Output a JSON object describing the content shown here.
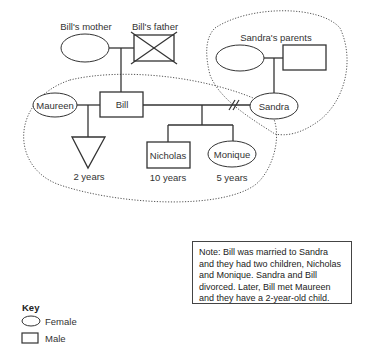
{
  "people": {
    "bills_mother": {
      "label": "Bill's mother",
      "sex": "female"
    },
    "bills_father": {
      "label": "Bill's father",
      "sex": "male",
      "deceased": true
    },
    "sandras_parents": {
      "label": "Sandra's parents"
    },
    "bill": {
      "label": "Bill",
      "sex": "male"
    },
    "maureen": {
      "label": "Maureen",
      "sex": "female"
    },
    "sandra": {
      "label": "Sandra",
      "sex": "female"
    },
    "unknown_child": {
      "age": "2 years",
      "sex": "unknown"
    },
    "nicholas": {
      "label": "Nicholas",
      "age": "10 years",
      "sex": "male"
    },
    "monique": {
      "label": "Monique",
      "age": "5 years",
      "sex": "female"
    }
  },
  "relationships": [
    {
      "between": [
        "bills_mother",
        "bills_father"
      ],
      "type": "married"
    },
    {
      "between": [
        "sandras_mother",
        "sandras_father"
      ],
      "type": "married"
    },
    {
      "between": [
        "bill",
        "maureen"
      ],
      "type": "married"
    },
    {
      "between": [
        "bill",
        "sandra"
      ],
      "type": "divorced"
    }
  ],
  "key": {
    "title": "Key",
    "items": [
      {
        "symbol": "ellipse",
        "label": "Female"
      },
      {
        "symbol": "square",
        "label": "Male"
      },
      {
        "symbol": "triangle",
        "label": "Sex unknown"
      },
      {
        "symbol": "line",
        "label": "Married"
      },
      {
        "symbol": "separated-line",
        "label": "Separated"
      },
      {
        "symbol": "divorced-line",
        "label": "Divorced"
      },
      {
        "symbol": "cross",
        "label": "Deceased"
      },
      {
        "symbol": "dotted-line",
        "label": "Boundary around people who all live together",
        "label_line1": "Boundary around people",
        "label_line2": "who all live together"
      }
    ]
  },
  "note": {
    "text": "Note: Bill was married to Sandra and they had two children, Nicholas and Monique. Sandra and Bill divorced. Later, Bill met Maureen and they have a 2-year-old child."
  },
  "colors": {
    "stroke": "#333333",
    "boundary": "#555555",
    "background": "#ffffff"
  }
}
